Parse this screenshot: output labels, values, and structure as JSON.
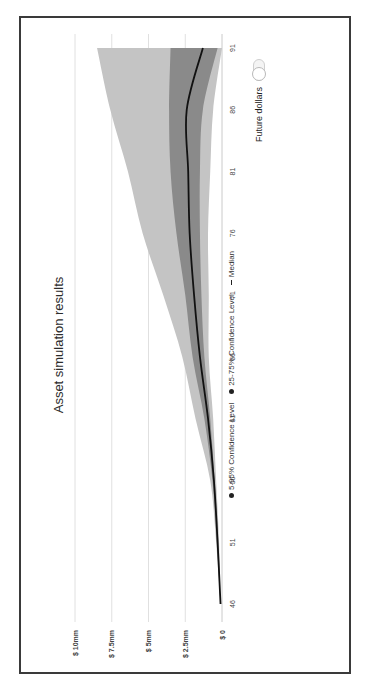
{
  "chart_data": {
    "type": "area",
    "title": "Asset simulation results",
    "xlabel": "Age",
    "ylabel": "Assets ($)",
    "x": [
      46,
      51,
      56,
      61,
      66,
      71,
      76,
      81,
      86,
      91
    ],
    "x_ticks": [
      "46",
      "51",
      "56",
      "61",
      "66",
      "71",
      "76",
      "81",
      "86",
      "91"
    ],
    "y_ticks": [
      "$ 0",
      "$ 2.5mm",
      "$ 5mm",
      "$ 7.5mm",
      "$ 10mm"
    ],
    "y_tick_values": [
      0,
      2.5,
      5,
      7.5,
      10
    ],
    "ylim": [
      0,
      10
    ],
    "units": "$ millions",
    "grid": true,
    "legend_position": "bottom",
    "orientation_note": "figure rotated 90 degrees in the screenshot",
    "series": [
      {
        "name": "5-95% Confidence Level",
        "kind": "band",
        "color": "#c4c4c4",
        "lower": [
          0.1,
          0.2,
          0.4,
          0.6,
          0.9,
          0.9,
          0.95,
          0.8,
          0.6,
          0.0
        ],
        "upper": [
          0.1,
          0.4,
          0.8,
          1.8,
          2.7,
          4.0,
          5.4,
          6.4,
          7.6,
          8.5
        ]
      },
      {
        "name": "25-75% Confidence Level",
        "kind": "band",
        "color": "#8a8a8a",
        "lower": [
          0.1,
          0.25,
          0.5,
          0.8,
          1.2,
          1.4,
          1.5,
          1.5,
          1.3,
          0.3
        ],
        "upper": [
          0.1,
          0.35,
          0.65,
          1.2,
          2.0,
          2.5,
          3.1,
          3.5,
          3.6,
          3.5
        ]
      },
      {
        "name": "Median",
        "kind": "line",
        "color": "#111111",
        "values": [
          0.1,
          0.3,
          0.55,
          0.95,
          1.5,
          1.9,
          2.2,
          2.3,
          2.4,
          1.3
        ]
      }
    ]
  },
  "chart": {
    "title": "Asset simulation results",
    "legend": [
      {
        "label": "5-95% Confidence Level",
        "marker": "dot"
      },
      {
        "label": "25-75% Confidence Level",
        "marker": "dot"
      },
      {
        "label": "Median",
        "marker": "line"
      }
    ]
  },
  "controls": {
    "future_dollars_label": "Future dollars",
    "future_dollars_toggle": "off"
  },
  "colors": {
    "outer_band": "#c4c4c4",
    "inner_band": "#8a8a8a",
    "median": "#111111",
    "grid": "#d8d8d8",
    "frame": "#3a3a3a"
  }
}
